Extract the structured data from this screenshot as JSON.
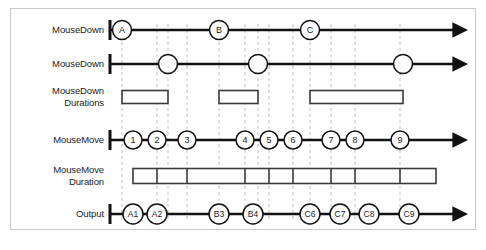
{
  "figure": {
    "caption": "",
    "background": "#ffffff",
    "frame_border_color": "#c9c9c9",
    "line_color": "#111111",
    "guide_color": "#bdbdbd",
    "bar_color": "#3a3a3a"
  },
  "rows": [
    {
      "id": "mousedown-1",
      "label": "MouseDown",
      "type": "axis",
      "axis_y": 30
    },
    {
      "id": "mousedown-2",
      "label": "MouseDown",
      "type": "axis",
      "axis_y": 64
    },
    {
      "id": "mousedown-durations",
      "label": "MouseDown\nDurations",
      "type": "bars",
      "axis_y": 97
    },
    {
      "id": "mousemove",
      "label": "MouseMove",
      "type": "axis",
      "axis_y": 140
    },
    {
      "id": "mousemove-duration",
      "label": "MouseMove\nDuration",
      "type": "bars",
      "axis_y": 176
    },
    {
      "id": "output",
      "label": "Output",
      "type": "axis",
      "axis_y": 214
    }
  ],
  "events": {
    "mousedown_press": [
      {
        "label": "A",
        "x": 122
      },
      {
        "label": "B",
        "x": 219
      },
      {
        "label": "C",
        "x": 310
      }
    ],
    "mousedown_release": [
      {
        "label": "",
        "x": 168
      },
      {
        "label": "",
        "x": 258
      },
      {
        "label": "",
        "x": 403
      }
    ],
    "mousemove": [
      {
        "label": "1",
        "x": 133
      },
      {
        "label": "2",
        "x": 157
      },
      {
        "label": "3",
        "x": 187
      },
      {
        "label": "4",
        "x": 245
      },
      {
        "label": "5",
        "x": 269
      },
      {
        "label": "6",
        "x": 293
      },
      {
        "label": "7",
        "x": 331
      },
      {
        "label": "8",
        "x": 355
      },
      {
        "label": "9",
        "x": 400
      }
    ],
    "output": [
      {
        "label": "A1",
        "x": 133
      },
      {
        "label": "A2",
        "x": 157
      },
      {
        "label": "B3",
        "x": 219
      },
      {
        "label": "B4",
        "x": 253
      },
      {
        "label": "C6",
        "x": 310
      },
      {
        "label": "C7",
        "x": 340
      },
      {
        "label": "C8",
        "x": 369
      },
      {
        "label": "C9",
        "x": 409
      }
    ]
  },
  "bars": {
    "mousedown_durations": [
      {
        "start": 122,
        "end": 168
      },
      {
        "start": 219,
        "end": 258
      },
      {
        "start": 310,
        "end": 403
      }
    ],
    "mousemove_duration": [
      {
        "start": 133,
        "end": 436,
        "dividers": [
          157,
          187,
          245,
          269,
          293,
          331,
          355,
          400
        ]
      }
    ]
  },
  "guides": [
    122,
    157,
    168,
    187,
    219,
    245,
    258,
    269,
    293,
    310,
    331,
    355,
    400
  ],
  "axes": {
    "origin_x": 110,
    "end_x": 455,
    "arrow": "right-arrow"
  }
}
